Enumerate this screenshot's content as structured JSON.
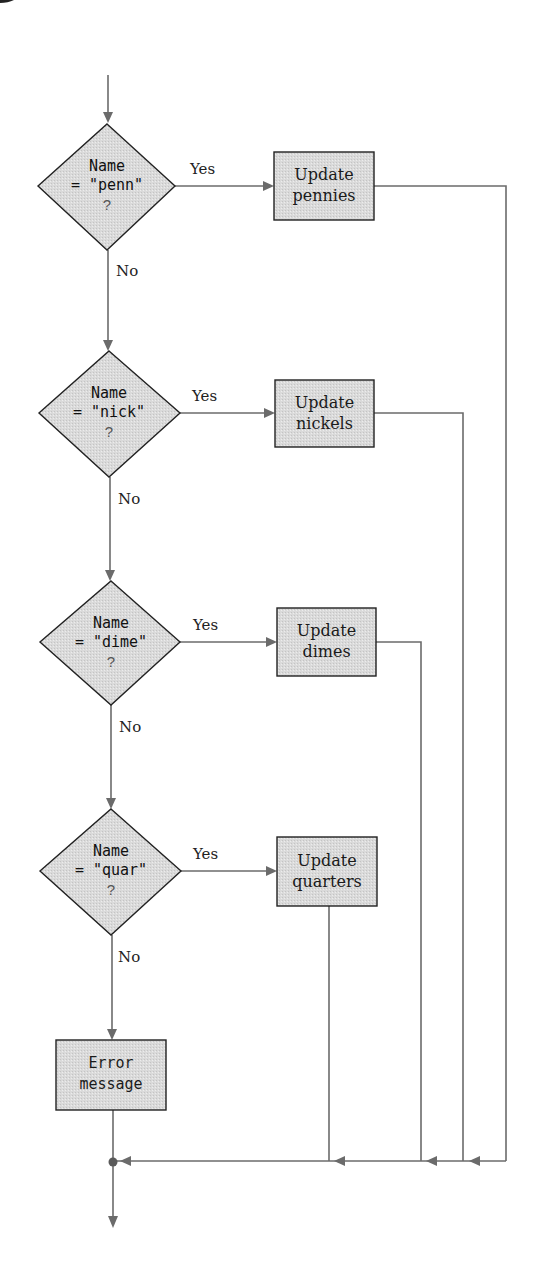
{
  "diagram": {
    "type": "flowchart",
    "colors": {
      "line": "#6b6b6b",
      "shape_fill": "#d9d9d9",
      "shape_border": "#222222",
      "background": "#ffffff"
    },
    "decisions": [
      {
        "id": "d1",
        "line1": "Name",
        "line2": "= \"penn\"",
        "line3": "?",
        "yes_label": "Yes",
        "no_label": "No"
      },
      {
        "id": "d2",
        "line1": "Name",
        "line2": "= \"nick\"",
        "line3": "?",
        "yes_label": "Yes",
        "no_label": "No"
      },
      {
        "id": "d3",
        "line1": "Name",
        "line2": "= \"dime\"",
        "line3": "?",
        "yes_label": "Yes",
        "no_label": "No"
      },
      {
        "id": "d4",
        "line1": "Name",
        "line2": "= \"quar\"",
        "line3": "?",
        "yes_label": "Yes",
        "no_label": "No"
      }
    ],
    "processes": [
      {
        "id": "p1",
        "line1": "Update",
        "line2": "pennies"
      },
      {
        "id": "p2",
        "line1": "Update",
        "line2": "nickels"
      },
      {
        "id": "p3",
        "line1": "Update",
        "line2": "dimes"
      },
      {
        "id": "p4",
        "line1": "Update",
        "line2": "quarters"
      }
    ],
    "error_box": {
      "line1": "Error",
      "line2": "message"
    },
    "edges": [
      {
        "from": "start",
        "to": "d1"
      },
      {
        "from": "d1",
        "to": "p1",
        "label": "Yes"
      },
      {
        "from": "d1",
        "to": "d2",
        "label": "No"
      },
      {
        "from": "d2",
        "to": "p2",
        "label": "Yes"
      },
      {
        "from": "d2",
        "to": "d3",
        "label": "No"
      },
      {
        "from": "d3",
        "to": "p3",
        "label": "Yes"
      },
      {
        "from": "d3",
        "to": "d4",
        "label": "No"
      },
      {
        "from": "d4",
        "to": "p4",
        "label": "Yes"
      },
      {
        "from": "d4",
        "to": "error",
        "label": "No"
      },
      {
        "from": "p1",
        "to": "merge"
      },
      {
        "from": "p2",
        "to": "merge"
      },
      {
        "from": "p3",
        "to": "merge"
      },
      {
        "from": "p4",
        "to": "merge"
      },
      {
        "from": "error",
        "to": "merge"
      },
      {
        "from": "merge",
        "to": "end"
      }
    ]
  }
}
